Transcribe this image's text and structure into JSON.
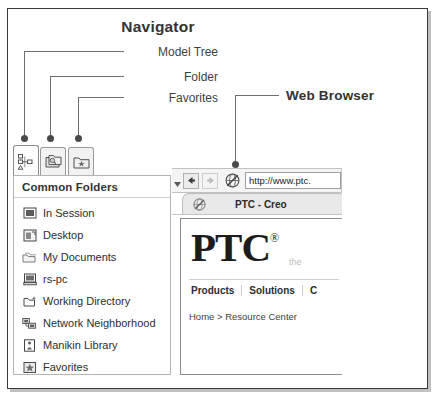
{
  "figure": {
    "title": "Navigator",
    "web_browser_title": "Web Browser",
    "callouts": [
      {
        "label": "Model Tree",
        "target": "model-tree-tab"
      },
      {
        "label": "Folder",
        "target": "folder-tab"
      },
      {
        "label": "Favorites",
        "target": "favorites-tab"
      }
    ]
  },
  "navigator": {
    "tabs": [
      {
        "name": "model-tree",
        "icon": "model-tree-icon",
        "selected": true
      },
      {
        "name": "folder",
        "icon": "folder-browser-icon",
        "selected": false
      },
      {
        "name": "favorites",
        "icon": "favorites-folder-icon",
        "selected": false
      }
    ],
    "panel_header": "Common Folders",
    "folders": [
      {
        "label": "In Session",
        "icon": "monitor-icon"
      },
      {
        "label": "Desktop",
        "icon": "desktop-icon"
      },
      {
        "label": "My Documents",
        "icon": "documents-folder-icon"
      },
      {
        "label": "rs-pc",
        "icon": "computer-icon"
      },
      {
        "label": "Working Directory",
        "icon": "working-directory-icon"
      },
      {
        "label": "Network Neighborhood",
        "icon": "network-icon"
      },
      {
        "label": "Manikin Library",
        "icon": "manikin-library-icon"
      },
      {
        "label": "Favorites",
        "icon": "favorites-icon"
      }
    ]
  },
  "browser": {
    "toolbar": {
      "overflow_caret": "▾",
      "back_label": "←",
      "forward_label": "→",
      "globe_icon": "globe-icon",
      "url_value": "http://www.ptc.",
      "url_placeholder": "http://"
    },
    "tab": {
      "icon": "globe-tab-icon",
      "title": "PTC - Creo"
    },
    "page": {
      "logo_text": "PTC",
      "logo_registered": "®",
      "tagline": "the",
      "nav_links": [
        "Products",
        "Solutions",
        "C"
      ],
      "breadcrumb": "Home > Resource Center"
    }
  },
  "colors": {
    "frame_border": "#3a3a3a",
    "leader_line": "#6e6e6e",
    "dot": "#4a4a4a",
    "title_text": "#333333",
    "panel_border": "#b4b4b4"
  }
}
